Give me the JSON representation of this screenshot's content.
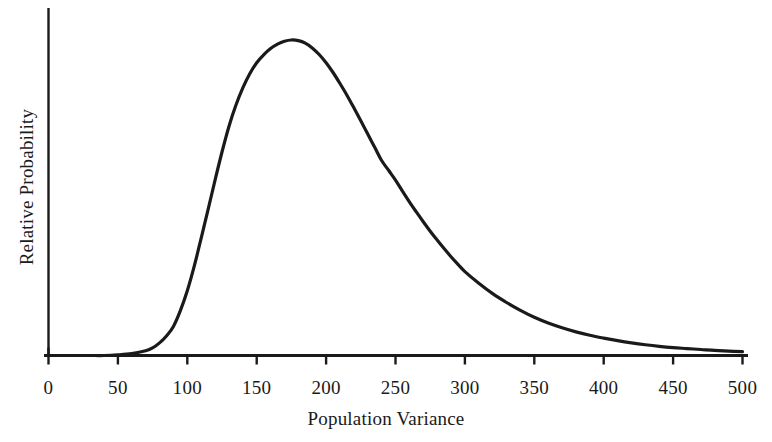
{
  "chart_data": {
    "type": "line",
    "title": "",
    "subtitle": "",
    "xlabel": "Population Variance",
    "ylabel": "Relative Probability",
    "xlim": [
      0,
      500
    ],
    "ylim": [
      0,
      1.0
    ],
    "grid": false,
    "legend": null,
    "legend_position": "none",
    "xticks": [
      "0",
      "50",
      "100",
      "150",
      "200",
      "250",
      "300",
      "350",
      "400",
      "450",
      "500"
    ],
    "xtick_values": [
      0,
      50,
      100,
      150,
      200,
      250,
      300,
      350,
      400,
      450,
      500
    ],
    "yticks": [],
    "annotations": [],
    "line_color": "#1a1a1a",
    "line_width": 3,
    "axis_color": "#1a1a1a",
    "background_color": "#ffffff",
    "series": [
      {
        "name": "Relative Probability",
        "x": [
          0,
          10,
          20,
          30,
          40,
          50,
          60,
          70,
          75,
          80,
          85,
          90,
          95,
          100,
          105,
          110,
          115,
          120,
          125,
          130,
          135,
          140,
          145,
          150,
          155,
          160,
          165,
          170,
          175,
          180,
          185,
          190,
          195,
          200,
          205,
          210,
          215,
          220,
          225,
          230,
          235,
          240,
          245,
          250,
          255,
          260,
          265,
          270,
          275,
          280,
          285,
          290,
          295,
          300,
          310,
          320,
          330,
          340,
          350,
          360,
          370,
          380,
          390,
          400,
          410,
          420,
          430,
          440,
          450,
          460,
          470,
          480,
          490,
          500
        ],
        "values": [
          0.0,
          0.0,
          0.0,
          0.0,
          0.0,
          0.002,
          0.006,
          0.015,
          0.024,
          0.04,
          0.062,
          0.092,
          0.142,
          0.205,
          0.283,
          0.372,
          0.463,
          0.556,
          0.645,
          0.726,
          0.793,
          0.848,
          0.893,
          0.928,
          0.953,
          0.973,
          0.987,
          0.996,
          1.0,
          0.998,
          0.99,
          0.975,
          0.954,
          0.928,
          0.897,
          0.862,
          0.825,
          0.785,
          0.744,
          0.702,
          0.66,
          0.618,
          0.587,
          0.556,
          0.521,
          0.487,
          0.455,
          0.424,
          0.394,
          0.366,
          0.339,
          0.313,
          0.289,
          0.266,
          0.229,
          0.196,
          0.168,
          0.143,
          0.121,
          0.103,
          0.088,
          0.075,
          0.064,
          0.055,
          0.047,
          0.04,
          0.034,
          0.029,
          0.025,
          0.022,
          0.019,
          0.016,
          0.014,
          0.012
        ]
      }
    ]
  },
  "axes": {
    "x_title": "Population Variance",
    "y_title": "Relative Probability"
  }
}
